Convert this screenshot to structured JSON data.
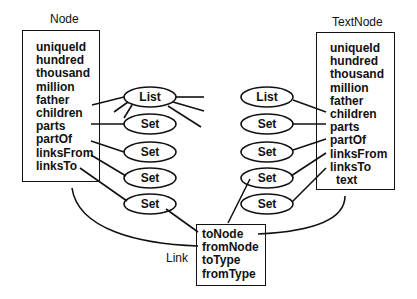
{
  "node": {
    "title": "Node",
    "fields": [
      "uniqueId",
      "hundred",
      "thousand",
      "million",
      "father",
      "children",
      "parts",
      "partOf",
      "linksFrom",
      "linksTo"
    ]
  },
  "textnode": {
    "title": "TextNode",
    "fields": [
      "uniqueId",
      "hundred",
      "thousand",
      "million",
      "father",
      "children",
      "parts",
      "partOf",
      "linksFrom",
      "linksTo",
      "text"
    ]
  },
  "link": {
    "title": "Link",
    "fields": [
      "toNode",
      "fromNode",
      "toType",
      "fromType"
    ]
  },
  "left_collections": [
    "List",
    "Set",
    "Set",
    "Set",
    "Set"
  ],
  "right_collections": [
    "List",
    "Set",
    "Set",
    "Set",
    "Set"
  ],
  "colors": {
    "stroke": "#111111",
    "background": "#ffffff"
  }
}
